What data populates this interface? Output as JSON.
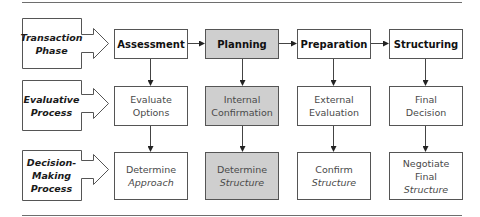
{
  "diagram": {
    "colors": {
      "highlight_fill": "#cfcfcf",
      "border": "#555555",
      "rule": "#6e6e6e"
    },
    "row_labels": [
      {
        "line1": "Transaction",
        "line2": "Phase",
        "line3": ""
      },
      {
        "line1": "Evaluative",
        "line2": "Process",
        "line3": ""
      },
      {
        "line1": "Decision-",
        "line2": "Making",
        "line3": "Process"
      }
    ],
    "columns": [
      {
        "phase": "Assessment",
        "evaluative": {
          "line1": "Evaluate",
          "line2": "Options"
        },
        "decision": {
          "line1": "Determine",
          "line2": "Approach",
          "line3": ""
        },
        "highlighted": false
      },
      {
        "phase": "Planning",
        "evaluative": {
          "line1": "Internal",
          "line2": "Confirmation"
        },
        "decision": {
          "line1": "Determine",
          "line2": "Structure",
          "line3": ""
        },
        "highlighted": true
      },
      {
        "phase": "Preparation",
        "evaluative": {
          "line1": "External",
          "line2": "Evaluation"
        },
        "decision": {
          "line1": "Confirm",
          "line2": "Structure",
          "line3": ""
        },
        "highlighted": false
      },
      {
        "phase": "Structuring",
        "evaluative": {
          "line1": "Final",
          "line2": "Decision"
        },
        "decision": {
          "line1": "Negotiate",
          "line2": "Final",
          "line3": "Structure"
        },
        "highlighted": false
      }
    ]
  }
}
